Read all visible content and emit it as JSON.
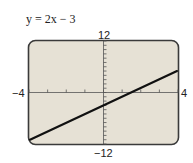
{
  "title": "y = 2x − 3",
  "labels": {
    "y_max": "12",
    "y_min": "−12",
    "x_min": "−4",
    "x_max": "4"
  },
  "colors": {
    "plot_bg": "#e6e1d5",
    "frame": "#3a3a3a",
    "line": "#111111",
    "axis": "#555555"
  },
  "chart_data": {
    "type": "line",
    "title": "y = 2x − 3",
    "xlabel": "",
    "ylabel": "",
    "xlim": [
      -4,
      4
    ],
    "ylim": [
      -12,
      12
    ],
    "xtick_step": 1,
    "ytick_step": 1,
    "grid": false,
    "series": [
      {
        "name": "y = 2x − 3",
        "x": [
          -4,
          -3,
          -2,
          -1,
          0,
          1,
          1.5,
          2,
          3,
          4
        ],
        "y": [
          -11,
          -9,
          -7,
          -5,
          -3,
          -1,
          0,
          1,
          3,
          5
        ]
      }
    ],
    "annotations": [
      "12",
      "−12",
      "−4",
      "4"
    ]
  }
}
